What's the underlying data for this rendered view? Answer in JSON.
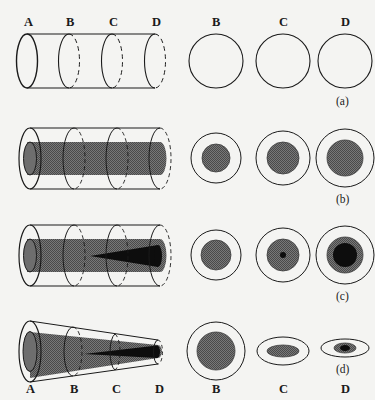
{
  "figure": {
    "background_color": "#f4f4f2",
    "stroke_color": "#1a1a1a",
    "gray_fill": "#6e6e6e",
    "black_fill": "#0d0d0d",
    "caption_style": "parenthesized-lowercase"
  },
  "station_labels": {
    "a": "A",
    "b": "B",
    "c": "C",
    "d": "D"
  },
  "rows": [
    {
      "id": "row-a",
      "caption": "(a)",
      "tube_type": "cylinder",
      "tube_description": "uniform open cylinder with four cross-section rings",
      "station_labels_position": "top",
      "stations": [
        "A",
        "B",
        "C",
        "D"
      ],
      "cross_sections": [
        {
          "label": "B",
          "outer_shape": "circle",
          "outer_radius": 27,
          "core": "none",
          "nucleus": "none"
        },
        {
          "label": "C",
          "outer_shape": "circle",
          "outer_radius": 27,
          "core": "none",
          "nucleus": "none"
        },
        {
          "label": "D",
          "outer_shape": "circle",
          "outer_radius": 27,
          "core": "none",
          "nucleus": "none"
        }
      ]
    },
    {
      "id": "row-b",
      "caption": "(b)",
      "tube_type": "cylinder",
      "tube_description": "uniform cylinder containing a uniform gray inner core",
      "station_labels_position": "none",
      "stations": [
        "A",
        "B",
        "C",
        "D"
      ],
      "cross_sections": [
        {
          "label": "B",
          "outer_shape": "circle",
          "outer_radius": 25,
          "core": "gray",
          "core_radius": 14,
          "nucleus": "none"
        },
        {
          "label": "C",
          "outer_shape": "circle",
          "outer_radius": 27,
          "core": "gray",
          "core_radius": 16,
          "nucleus": "none"
        },
        {
          "label": "D",
          "outer_shape": "circle",
          "outer_radius": 29,
          "core": "gray",
          "core_radius": 18,
          "nucleus": "none"
        }
      ]
    },
    {
      "id": "row-c",
      "caption": "(c)",
      "tube_type": "cylinder",
      "tube_description": "uniform cylinder with gray core and a black wedge widening toward D",
      "station_labels_position": "none",
      "stations": [
        "A",
        "B",
        "C",
        "D"
      ],
      "cross_sections": [
        {
          "label": "B",
          "outer_shape": "circle",
          "outer_radius": 25,
          "core": "gray",
          "core_radius": 15,
          "nucleus": "none"
        },
        {
          "label": "C",
          "outer_shape": "circle",
          "outer_radius": 27,
          "core": "gray",
          "core_radius": 16,
          "nucleus": "black",
          "nucleus_radius": 3
        },
        {
          "label": "D",
          "outer_shape": "circle",
          "outer_radius": 29,
          "core": "gray",
          "core_radius": 18,
          "nucleus": "black",
          "nucleus_radius": 12
        }
      ]
    },
    {
      "id": "row-d",
      "caption": "(d)",
      "tube_type": "cone",
      "tube_description": "tapering cone narrowing from A to D with gray core and black wedge",
      "station_labels_position": "bottom",
      "stations": [
        "A",
        "B",
        "C",
        "D"
      ],
      "cross_sections": [
        {
          "label": "B",
          "outer_shape": "circle",
          "outer_radius": 29,
          "core": "gray",
          "core_radius": 19,
          "nucleus": "none"
        },
        {
          "label": "C",
          "outer_shape": "ellipse",
          "outer_rx": 26,
          "outer_ry": 14,
          "core": "gray",
          "core_rx": 16,
          "core_ry": 6,
          "nucleus": "none"
        },
        {
          "label": "D",
          "outer_shape": "ellipse",
          "outer_rx": 24,
          "outer_ry": 9,
          "core": "gray",
          "core_rx": 11,
          "core_ry": 5,
          "nucleus": "black",
          "nucleus_rx": 5,
          "nucleus_ry": 3
        }
      ]
    }
  ],
  "captions": {
    "a": "(a)",
    "b": "(b)",
    "c": "(c)",
    "d": "(d)"
  }
}
